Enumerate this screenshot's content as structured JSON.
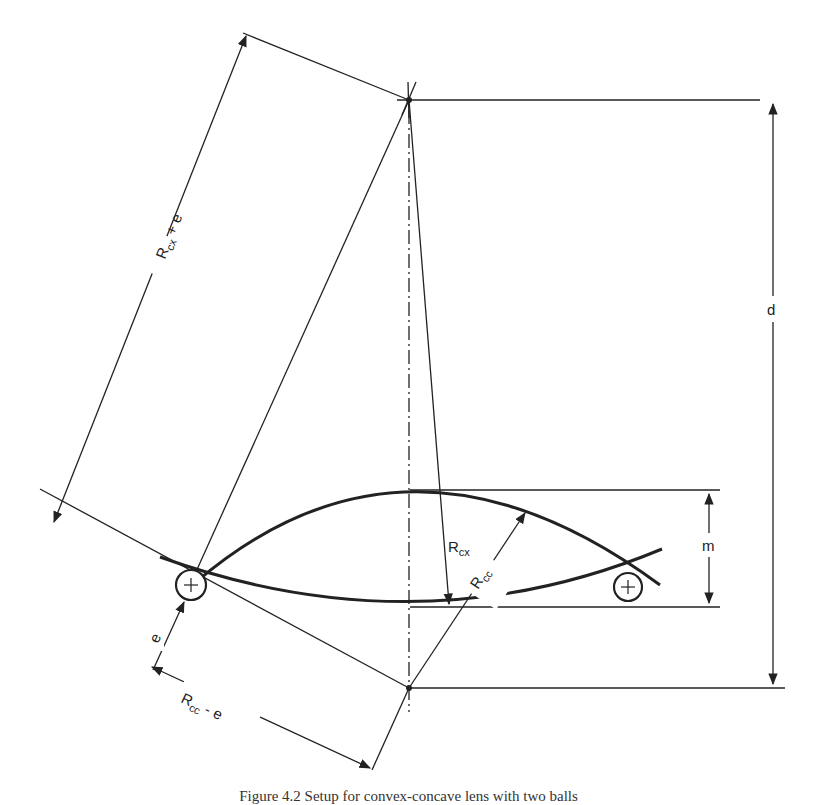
{
  "figure": {
    "labels": {
      "rcx_plus_e": {
        "main": "R",
        "sub": "cx",
        "suffix": " + e"
      },
      "rcx": {
        "main": "R",
        "sub": "cx"
      },
      "rcc": {
        "main": "R",
        "sub": "cc"
      },
      "rcc_minus_e": {
        "main": "R",
        "sub": "cc",
        "suffix": " - e"
      },
      "e": "e",
      "d": "d",
      "m": "m",
      "ball_symbol": "+"
    },
    "caption": "Figure 4.2   Setup for convex-concave lens with two balls"
  },
  "colors": {
    "line": "#222222",
    "background": "#ffffff"
  }
}
